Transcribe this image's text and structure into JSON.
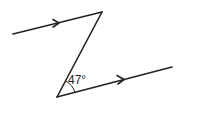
{
  "diagram": {
    "type": "geometry-parallel-lines-z-angle",
    "angle_label": "47°",
    "stroke_color": "#222222",
    "background": "#ffffff",
    "segments": [
      {
        "name": "top-parallel-line",
        "from": [
          13,
          34
        ],
        "to": [
          102,
          12
        ],
        "arrow": true
      },
      {
        "name": "transversal",
        "from": [
          102,
          12
        ],
        "to": [
          57,
          97
        ],
        "arrow": false
      },
      {
        "name": "bottom-parallel-line",
        "from": [
          57,
          97
        ],
        "to": [
          172,
          67
        ],
        "arrow": true
      }
    ]
  }
}
